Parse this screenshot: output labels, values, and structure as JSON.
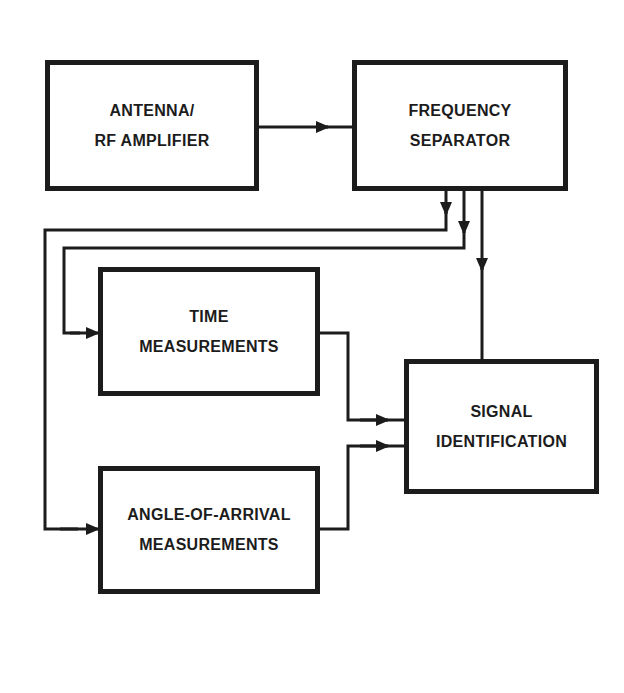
{
  "diagram": {
    "type": "block-diagram",
    "colors": {
      "line": "#1c1c1c",
      "background": "#ffffff"
    },
    "blocks": {
      "antenna": {
        "line1": "ANTENNA/",
        "line2": "RF AMPLIFIER"
      },
      "frequency_separator": {
        "line1": "FREQUENCY",
        "line2": "SEPARATOR"
      },
      "time_measurements": {
        "line1": "TIME",
        "line2": "MEASUREMENTS"
      },
      "signal_identification": {
        "line1": "SIGNAL",
        "line2": "IDENTIFICATION"
      },
      "angle_of_arrival": {
        "line1": "ANGLE-OF-ARRIVAL",
        "line2": "MEASUREMENTS"
      }
    },
    "connections": [
      {
        "from": "ANTENNA/RF AMPLIFIER",
        "to": "FREQUENCY SEPARATOR"
      },
      {
        "from": "FREQUENCY SEPARATOR",
        "to": "ANGLE-OF-ARRIVAL MEASUREMENTS"
      },
      {
        "from": "FREQUENCY SEPARATOR",
        "to": "TIME MEASUREMENTS"
      },
      {
        "from": "FREQUENCY SEPARATOR",
        "to": "SIGNAL IDENTIFICATION"
      },
      {
        "from": "TIME MEASUREMENTS",
        "to": "SIGNAL IDENTIFICATION"
      },
      {
        "from": "ANGLE-OF-ARRIVAL MEASUREMENTS",
        "to": "SIGNAL IDENTIFICATION"
      }
    ]
  }
}
